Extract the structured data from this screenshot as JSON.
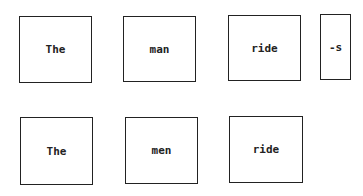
{
  "rows": [
    {
      "boxes": [
        {
          "text": "The"
        },
        {
          "text": "man"
        },
        {
          "text": "ride"
        },
        {
          "text": "-s"
        }
      ]
    },
    {
      "boxes": [
        {
          "text": "The"
        },
        {
          "text": "men"
        },
        {
          "text": "ride"
        }
      ]
    }
  ]
}
